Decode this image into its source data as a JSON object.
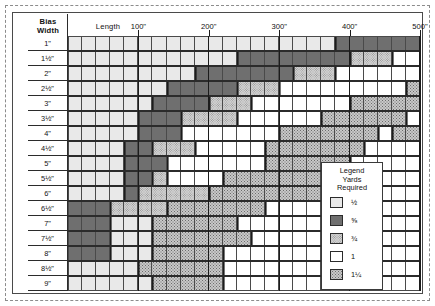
{
  "chart_data": {
    "type": "heatmap",
    "xlabel": "Length",
    "ylabel": "Bias Width",
    "corner_label_line1": "Bias",
    "corner_label_line2": "Width",
    "x_axis_caption": "Length",
    "x_tick_labels": [
      "100\"",
      "200\"",
      "300\"",
      "400\"",
      "500\""
    ],
    "x_tick_values": [
      100,
      200,
      300,
      400,
      500
    ],
    "xlim": [
      0,
      500
    ],
    "column_count": 25,
    "column_step_inches": 20,
    "grid": true,
    "legend_position": "inside-right",
    "legend": {
      "title": "Legend",
      "subtitle_line1": "Yards",
      "subtitle_line2": "Required",
      "entries": [
        {
          "key": "half",
          "label": "½",
          "value": 0.5
        },
        {
          "key": "fiveeighth",
          "label": "⅝",
          "value": 0.625
        },
        {
          "key": "threequarter",
          "label": "¾",
          "value": 0.75
        },
        {
          "key": "one",
          "label": "1",
          "value": 1
        },
        {
          "key": "oneandquarter",
          "label": "1¼",
          "value": 1.25
        }
      ]
    },
    "categories": [
      "1\"",
      "1½\"",
      "2\"",
      "2½\"",
      "3\"",
      "3½\"",
      "4\"",
      "4½\"",
      "5\"",
      "5½\"",
      "6\"",
      "6½\"",
      "7\"",
      "7½\"",
      "8\"",
      "8½\"",
      "9\""
    ],
    "rows": [
      {
        "label": "1\"",
        "bands": [
          {
            "fill": "half",
            "span": 19
          },
          {
            "fill": "fiveeighth",
            "span": 6
          }
        ]
      },
      {
        "label": "1½\"",
        "bands": [
          {
            "fill": "half",
            "span": 12
          },
          {
            "fill": "fiveeighth",
            "span": 8
          },
          {
            "fill": "threequarter",
            "span": 3
          },
          {
            "fill": "one",
            "span": 2
          }
        ]
      },
      {
        "label": "2\"",
        "bands": [
          {
            "fill": "half",
            "span": 9
          },
          {
            "fill": "fiveeighth",
            "span": 7
          },
          {
            "fill": "threequarter",
            "span": 3
          },
          {
            "fill": "one",
            "span": 6
          }
        ]
      },
      {
        "label": "2½\"",
        "bands": [
          {
            "fill": "half",
            "span": 7
          },
          {
            "fill": "fiveeighth",
            "span": 5
          },
          {
            "fill": "threequarter",
            "span": 3
          },
          {
            "fill": "one",
            "span": 9
          },
          {
            "fill": "oneandquarter",
            "span": 1
          }
        ]
      },
      {
        "label": "3\"",
        "bands": [
          {
            "fill": "half",
            "span": 6
          },
          {
            "fill": "fiveeighth",
            "span": 4
          },
          {
            "fill": "threequarter",
            "span": 3
          },
          {
            "fill": "one",
            "span": 7
          },
          {
            "fill": "oneandquarter",
            "span": 5
          }
        ]
      },
      {
        "label": "3½\"",
        "bands": [
          {
            "fill": "half",
            "span": 5
          },
          {
            "fill": "fiveeighth",
            "span": 3
          },
          {
            "fill": "threequarter",
            "span": 4
          },
          {
            "fill": "one",
            "span": 6
          },
          {
            "fill": "oneandquarter",
            "span": 6
          },
          {
            "fill": "one",
            "span": 1
          }
        ]
      },
      {
        "label": "4\"",
        "bands": [
          {
            "fill": "half",
            "span": 5
          },
          {
            "fill": "fiveeighth",
            "span": 3
          },
          {
            "fill": "one",
            "span": 7
          },
          {
            "fill": "oneandquarter",
            "span": 7
          },
          {
            "fill": "one",
            "span": 1
          },
          {
            "fill": "oneandquarter",
            "span": 2
          }
        ]
      },
      {
        "label": "4½\"",
        "bands": [
          {
            "fill": "half",
            "span": 4
          },
          {
            "fill": "fiveeighth",
            "span": 2
          },
          {
            "fill": "threequarter",
            "span": 3
          },
          {
            "fill": "one",
            "span": 5
          },
          {
            "fill": "oneandquarter",
            "span": 7
          },
          {
            "fill": "one",
            "span": 4
          }
        ]
      },
      {
        "label": "5\"",
        "bands": [
          {
            "fill": "half",
            "span": 4
          },
          {
            "fill": "fiveeighth",
            "span": 3
          },
          {
            "fill": "one",
            "span": 7
          },
          {
            "fill": "oneandquarter",
            "span": 6
          },
          {
            "fill": "one",
            "span": 5
          }
        ]
      },
      {
        "label": "5½\"",
        "bands": [
          {
            "fill": "half",
            "span": 4
          },
          {
            "fill": "fiveeighth",
            "span": 2
          },
          {
            "fill": "threequarter",
            "span": 1
          },
          {
            "fill": "one",
            "span": 4
          },
          {
            "fill": "oneandquarter",
            "span": 8
          },
          {
            "fill": "one",
            "span": 6
          }
        ]
      },
      {
        "label": "6\"",
        "bands": [
          {
            "fill": "half",
            "span": 4
          },
          {
            "fill": "fiveeighth",
            "span": 1
          },
          {
            "fill": "threequarter",
            "span": 5
          },
          {
            "fill": "oneandquarter",
            "span": 9
          },
          {
            "fill": "one",
            "span": 6
          }
        ]
      },
      {
        "label": "6½\"",
        "bands": [
          {
            "fill": "fiveeighth",
            "span": 3
          },
          {
            "fill": "threequarter",
            "span": 4
          },
          {
            "fill": "oneandquarter",
            "span": 7
          },
          {
            "fill": "one",
            "span": 11
          }
        ]
      },
      {
        "label": "7\"",
        "bands": [
          {
            "fill": "fiveeighth",
            "span": 3
          },
          {
            "fill": "half",
            "span": 3
          },
          {
            "fill": "oneandquarter",
            "span": 6
          },
          {
            "fill": "one",
            "span": 13
          }
        ]
      },
      {
        "label": "7½\"",
        "bands": [
          {
            "fill": "fiveeighth",
            "span": 3
          },
          {
            "fill": "half",
            "span": 3
          },
          {
            "fill": "oneandquarter",
            "span": 7
          },
          {
            "fill": "one",
            "span": 12
          }
        ]
      },
      {
        "label": "8\"",
        "bands": [
          {
            "fill": "fiveeighth",
            "span": 3
          },
          {
            "fill": "half",
            "span": 3
          },
          {
            "fill": "oneandquarter",
            "span": 5
          },
          {
            "fill": "one",
            "span": 14
          }
        ]
      },
      {
        "label": "8½\"",
        "bands": [
          {
            "fill": "half",
            "span": 5
          },
          {
            "fill": "oneandquarter",
            "span": 6
          },
          {
            "fill": "one",
            "span": 14
          }
        ]
      },
      {
        "label": "9\"",
        "bands": [
          {
            "fill": "half",
            "span": 6
          },
          {
            "fill": "oneandquarter",
            "span": 5
          },
          {
            "fill": "one",
            "span": 14
          }
        ]
      }
    ]
  }
}
